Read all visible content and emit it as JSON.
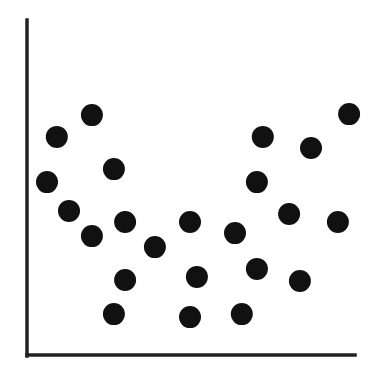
{
  "chart_data": {
    "type": "scatter",
    "title": "",
    "xlabel": "",
    "ylabel": "",
    "xlim": [
      0,
      100
    ],
    "ylim": [
      0,
      100
    ],
    "grid": false,
    "legend": "none",
    "marker_color": "#111111",
    "axis_color": "#222222",
    "points": [
      {
        "x": 6.1,
        "y": 51.6
      },
      {
        "x": 9.1,
        "y": 65.1
      },
      {
        "x": 12.8,
        "y": 43.0
      },
      {
        "x": 19.8,
        "y": 71.6
      },
      {
        "x": 19.8,
        "y": 35.5
      },
      {
        "x": 26.5,
        "y": 55.5
      },
      {
        "x": 26.5,
        "y": 12.2
      },
      {
        "x": 29.9,
        "y": 39.7
      },
      {
        "x": 29.9,
        "y": 22.4
      },
      {
        "x": 39.0,
        "y": 32.2
      },
      {
        "x": 49.7,
        "y": 11.3
      },
      {
        "x": 49.7,
        "y": 39.7
      },
      {
        "x": 51.8,
        "y": 23.3
      },
      {
        "x": 63.4,
        "y": 36.4
      },
      {
        "x": 65.5,
        "y": 12.2
      },
      {
        "x": 70.1,
        "y": 25.7
      },
      {
        "x": 70.1,
        "y": 51.6
      },
      {
        "x": 71.9,
        "y": 65.1
      },
      {
        "x": 79.9,
        "y": 42.1
      },
      {
        "x": 83.2,
        "y": 22.1
      },
      {
        "x": 86.6,
        "y": 61.8
      },
      {
        "x": 94.8,
        "y": 39.7
      },
      {
        "x": 98.2,
        "y": 71.9
      }
    ]
  }
}
